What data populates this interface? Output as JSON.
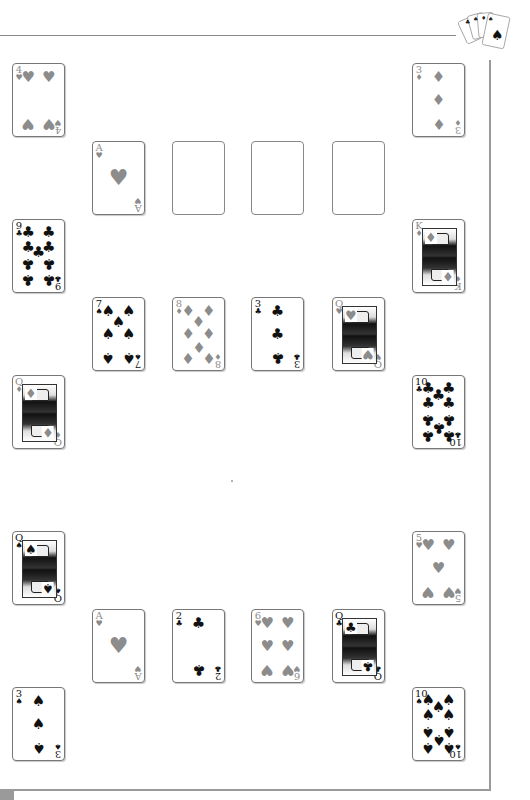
{
  "game": {
    "type": "card-solitaire-layout",
    "suit_colors": {
      "red": "#8c8c8c",
      "black": "#111111"
    },
    "logo": {
      "name": "four-aces-logo",
      "cards": [
        "A♣",
        "A♠",
        "A♦",
        "A♠"
      ]
    }
  },
  "left_column": [
    {
      "rank": "4",
      "suit": "♥",
      "color": "red",
      "pips": 4
    },
    {
      "rank": "9",
      "suit": "♣",
      "color": "black",
      "pips": 9
    },
    {
      "rank": "Q",
      "suit": "♦",
      "color": "red",
      "face": true
    },
    {
      "rank": "Q",
      "suit": "♠",
      "color": "black",
      "face": true
    },
    {
      "rank": "3",
      "suit": "♠",
      "color": "black",
      "pips": 3
    }
  ],
  "right_column": [
    {
      "rank": "3",
      "suit": "♦",
      "color": "red",
      "pips": 3
    },
    {
      "rank": "K",
      "suit": "♦",
      "color": "red",
      "face": true
    },
    {
      "rank": "10",
      "suit": "♣",
      "color": "black",
      "pips": 10
    },
    {
      "rank": "5",
      "suit": "♥",
      "color": "red",
      "pips": 5
    },
    {
      "rank": "10",
      "suit": "♠",
      "color": "black",
      "pips": 10
    }
  ],
  "rows": [
    {
      "cards": [
        {
          "rank": "A",
          "suit": "♥",
          "color": "red",
          "pips": 1
        },
        {
          "empty": true
        },
        {
          "empty": true
        },
        {
          "empty": true
        }
      ]
    },
    {
      "cards": [
        {
          "rank": "7",
          "suit": "♠",
          "color": "black",
          "pips": 7
        },
        {
          "rank": "8",
          "suit": "♦",
          "color": "red",
          "pips": 8
        },
        {
          "rank": "3",
          "suit": "♣",
          "color": "black",
          "pips": 3
        },
        {
          "rank": "Q",
          "suit": "♥",
          "color": "red",
          "face": true
        }
      ]
    },
    {
      "cards": [
        {
          "rank": "A",
          "suit": "♥",
          "color": "red",
          "pips": 1
        },
        {
          "rank": "2",
          "suit": "♣",
          "color": "black",
          "pips": 2
        },
        {
          "rank": "6",
          "suit": "♥",
          "color": "red",
          "pips": 6
        },
        {
          "rank": "Q",
          "suit": "♣",
          "color": "black",
          "face": true
        }
      ]
    }
  ]
}
